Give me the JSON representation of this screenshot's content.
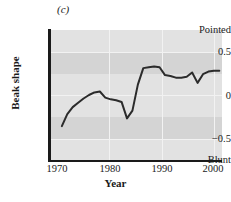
{
  "panel": {
    "label": "(c)"
  },
  "axes": {
    "y_title": "Beak shape",
    "x_title": "Year",
    "y_ticks": [
      "Pointed",
      "0.5",
      "0",
      "−0.5",
      "Blunt"
    ],
    "x_ticks": [
      "1970",
      "1980",
      "1990",
      "2000"
    ]
  },
  "colors": {
    "plot_background": "#d4d4d4",
    "band": "#e2e2e2",
    "gridline": "#f2f2f2",
    "line": "#2b2b2b",
    "axis": "#1a1a1a"
  },
  "chart_data": {
    "type": "line",
    "title": "(c)",
    "xlabel": "Year",
    "ylabel": "Beak shape",
    "xlim": [
      1970,
      2001.5
    ],
    "ylim": [
      -0.75,
      0.75
    ],
    "ylim_labels": {
      "top": "Pointed",
      "bottom": "Blunt"
    },
    "grid": true,
    "legend": "none",
    "yticks": [
      0.5,
      0,
      -0.5
    ],
    "ytick_labels": [
      "0.5",
      "0",
      "−0.5"
    ],
    "xticks": [
      1970,
      1980,
      1990,
      2000
    ],
    "series": [
      {
        "name": "Beak shape",
        "x": [
          1972,
          1973,
          1974,
          1975,
          1976,
          1977,
          1978,
          1979,
          1980,
          1981,
          1982,
          1983,
          1984,
          1985,
          1986,
          1987,
          1988,
          1989,
          1990,
          1991,
          1992,
          1993,
          1994,
          1995,
          1996,
          1997,
          1998,
          1999,
          2000,
          2001
        ],
        "y": [
          -0.36,
          -0.22,
          -0.14,
          -0.09,
          -0.04,
          0.0,
          0.03,
          0.04,
          -0.03,
          -0.05,
          -0.06,
          -0.08,
          -0.27,
          -0.18,
          0.12,
          0.31,
          0.32,
          0.33,
          0.32,
          0.23,
          0.22,
          0.2,
          0.2,
          0.21,
          0.26,
          0.14,
          0.24,
          0.27,
          0.28,
          0.28
        ]
      }
    ]
  }
}
